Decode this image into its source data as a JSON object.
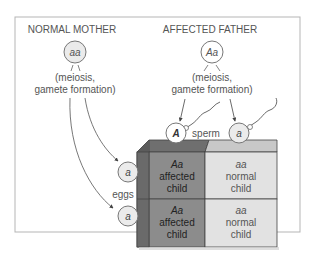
{
  "mother": {
    "title": "NORMAL MOTHER",
    "genotype": "aa",
    "process_line1": "(meiosis,",
    "process_line2": "gamete formation)"
  },
  "father": {
    "title": "AFFECTED FATHER",
    "genotype": "Aa",
    "process_line1": "(meiosis,",
    "process_line2": "gamete formation)"
  },
  "gametes": {
    "sperm_label": "sperm",
    "eggs_label": "eggs",
    "sperm": [
      "A",
      "a"
    ],
    "eggs": [
      "a",
      "a"
    ]
  },
  "punnett": {
    "cells": [
      {
        "genotype": "Aa",
        "line1": "affected",
        "line2": "child"
      },
      {
        "genotype": "aa",
        "line1": "normal",
        "line2": "child"
      },
      {
        "genotype": "Aa",
        "line1": "affected",
        "line2": "child"
      },
      {
        "genotype": "aa",
        "line1": "normal",
        "line2": "child"
      }
    ]
  },
  "colors": {
    "affected": "#8c8c8c",
    "normal": "#e2e2e2",
    "affected_top": "#6f6f6f",
    "normal_top": "#c8c8c8",
    "side": "#6a6a6a",
    "frame": "#b5b5b5",
    "circle_fill": "#ebebeb"
  }
}
